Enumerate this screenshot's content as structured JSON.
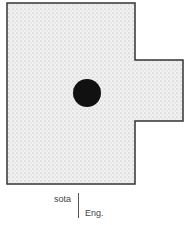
{
  "diagram": {
    "shape": "floor-plan-outline",
    "fill_color": "#e4e4e4",
    "stroke_color": "#333333",
    "marker_color": "#111111",
    "outline_points": [
      [
        7,
        3
      ],
      [
        135,
        3
      ],
      [
        135,
        60
      ],
      [
        183,
        60
      ],
      [
        183,
        121
      ],
      [
        135,
        121
      ],
      [
        135,
        184
      ],
      [
        7,
        184
      ]
    ],
    "marker": {
      "cx": 87,
      "cy": 93,
      "r": 14
    }
  },
  "labels": {
    "term": "sota",
    "language": "Eng."
  }
}
